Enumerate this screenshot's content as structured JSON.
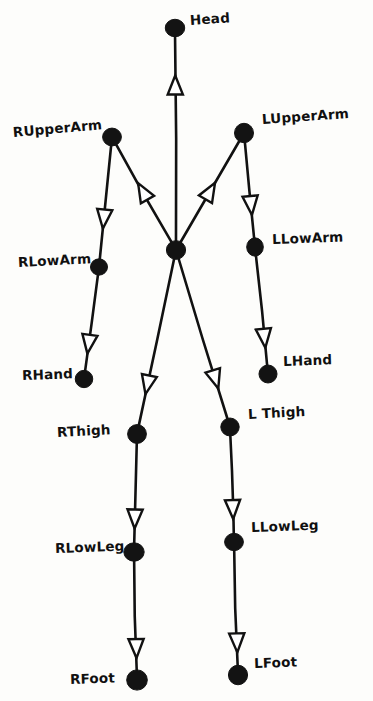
{
  "diagram": {
    "style": "hand-drawn",
    "background_color": "#fdfdfb",
    "node_color": "#131313",
    "edge_color": "#111111",
    "arrow_fill": "#ffffff",
    "width": 373,
    "height": 701,
    "root_node": "root",
    "nodes": [
      {
        "id": "root",
        "label": "",
        "x": 176,
        "y": 250,
        "r": 9.5,
        "label_x": 0,
        "label_y": 0,
        "rotate": 0
      },
      {
        "id": "head",
        "label": "Head",
        "x": 175,
        "y": 28,
        "r": 9.5,
        "label_x": 190,
        "label_y": 14,
        "rotate": -4
      },
      {
        "id": "rupperarm",
        "label": "RUpperArm",
        "x": 112,
        "y": 137,
        "r": 9.5,
        "label_x": 13,
        "label_y": 126,
        "rotate": -5
      },
      {
        "id": "rlowarm",
        "label": "RLowArm",
        "x": 99,
        "y": 267,
        "r": 9.0,
        "label_x": 18,
        "label_y": 256,
        "rotate": -3
      },
      {
        "id": "rhand",
        "label": "RHand",
        "x": 84,
        "y": 379,
        "r": 9.0,
        "label_x": 22,
        "label_y": 369,
        "rotate": -2
      },
      {
        "id": "lupperarm",
        "label": "LUpperArm",
        "x": 244,
        "y": 133,
        "r": 9.5,
        "label_x": 262,
        "label_y": 113,
        "rotate": -4
      },
      {
        "id": "llowarm",
        "label": "LLowArm",
        "x": 255,
        "y": 247,
        "r": 9.0,
        "label_x": 272,
        "label_y": 233,
        "rotate": -2
      },
      {
        "id": "lhand",
        "label": "LHand",
        "x": 268,
        "y": 374,
        "r": 9.5,
        "label_x": 283,
        "label_y": 355,
        "rotate": -2
      },
      {
        "id": "rthigh",
        "label": "RThigh",
        "x": 137,
        "y": 434,
        "r": 9.5,
        "label_x": 57,
        "label_y": 426,
        "rotate": -3
      },
      {
        "id": "rlowleg",
        "label": "RLowLeg",
        "x": 134,
        "y": 552,
        "r": 9.5,
        "label_x": 55,
        "label_y": 542,
        "rotate": -2
      },
      {
        "id": "rfoot",
        "label": "RFoot",
        "x": 137,
        "y": 680,
        "r": 10.0,
        "label_x": 70,
        "label_y": 673,
        "rotate": -2
      },
      {
        "id": "lthigh",
        "label": "L Thigh",
        "x": 230,
        "y": 427,
        "r": 9.5,
        "label_x": 248,
        "label_y": 408,
        "rotate": -3
      },
      {
        "id": "llowleg",
        "label": "LLowLeg",
        "x": 234,
        "y": 542,
        "r": 9.5,
        "label_x": 251,
        "label_y": 521,
        "rotate": -2
      },
      {
        "id": "lfoot",
        "label": "LFoot",
        "x": 238,
        "y": 675,
        "r": 10.0,
        "label_x": 254,
        "label_y": 657,
        "rotate": -2
      }
    ],
    "edges": [
      {
        "id": "edge-root-head",
        "from": "root",
        "to": "head",
        "arrow_t": 0.8
      },
      {
        "id": "edge-root-rupperarm",
        "from": "root",
        "to": "rupperarm",
        "arrow_t": 0.6
      },
      {
        "id": "edge-rupperarm-rlowarm",
        "from": "rupperarm",
        "to": "rlowarm",
        "arrow_t": 0.72
      },
      {
        "id": "edge-rlowarm-rhand",
        "from": "rlowarm",
        "to": "rhand",
        "arrow_t": 0.8
      },
      {
        "id": "edge-root-lupperarm",
        "from": "root",
        "to": "lupperarm",
        "arrow_t": 0.58
      },
      {
        "id": "edge-lupperarm-llowarm",
        "from": "lupperarm",
        "to": "llowarm",
        "arrow_t": 0.74
      },
      {
        "id": "edge-llowarm-lhand",
        "from": "llowarm",
        "to": "lhand",
        "arrow_t": 0.82
      },
      {
        "id": "edge-root-rthigh",
        "from": "root",
        "to": "rthigh",
        "arrow_t": 0.8
      },
      {
        "id": "edge-rthigh-rlowleg",
        "from": "rthigh",
        "to": "rlowleg",
        "arrow_t": 0.83
      },
      {
        "id": "edge-rlowleg-rfoot",
        "from": "rlowleg",
        "to": "rfoot",
        "arrow_t": 0.86
      },
      {
        "id": "edge-root-lthigh",
        "from": "root",
        "to": "lthigh",
        "arrow_t": 0.8
      },
      {
        "id": "edge-lthigh-llowleg",
        "from": "lthigh",
        "to": "llowleg",
        "arrow_t": 0.83
      },
      {
        "id": "edge-llowleg-lfoot",
        "from": "llowleg",
        "to": "lfoot",
        "arrow_t": 0.86
      }
    ]
  }
}
